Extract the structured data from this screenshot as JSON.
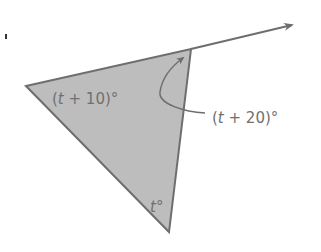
{
  "figure": {
    "type": "triangle with exterior angle",
    "colors": {
      "fill": "#bdbdbd",
      "stroke": "#6e6e6e",
      "label": "#707070",
      "background": "#ffffff"
    },
    "vertices": {
      "left": [
        26,
        86
      ],
      "top": [
        191,
        49
      ],
      "bottom": [
        169,
        232
      ]
    },
    "ray_end": [
      293,
      25
    ],
    "labels": {
      "left_angle": {
        "open": "(",
        "var": "t",
        "rest": " + 10)°"
      },
      "exterior_angle": {
        "open": "(",
        "var": "t",
        "rest": " + 20)°"
      },
      "bottom_angle": {
        "var": "t",
        "rest": "°"
      }
    }
  }
}
